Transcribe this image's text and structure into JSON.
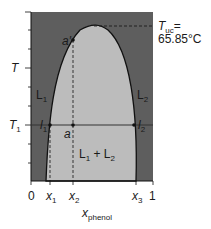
{
  "diagram": {
    "type": "liquid-liquid phase diagram",
    "colors": {
      "outside": "#5e5e5e",
      "inside": "#bcbcbc",
      "line": "#111111"
    },
    "labels": {
      "tuc_symbol": "T",
      "tuc_sub": "uc",
      "tuc_eq": "=",
      "tuc_value": "65.85°C",
      "y_T": "T",
      "y_T1": "T",
      "y_T1_sub": "1",
      "region_L1": "L",
      "region_L1_sub": "1",
      "region_L2": "L",
      "region_L2_sub": "2",
      "region_mix": "L",
      "region_mix_sub1": "1",
      "region_mix_plus": " + L",
      "region_mix_sub2": "2",
      "point_a": "a",
      "point_a_prime": "a′",
      "point_l1": "l",
      "point_l1_sub": "1",
      "point_l2": "l",
      "point_l2_sub": "2",
      "x_tick_0": "0",
      "x_tick_x1": "x",
      "x_tick_x1_sub": "1",
      "x_tick_x2": "x",
      "x_tick_x2_sub": "2",
      "x_tick_x3": "x",
      "x_tick_x3_sub": "3",
      "x_tick_1": "1",
      "x_axis": "x",
      "x_axis_sub": "phenol"
    }
  }
}
